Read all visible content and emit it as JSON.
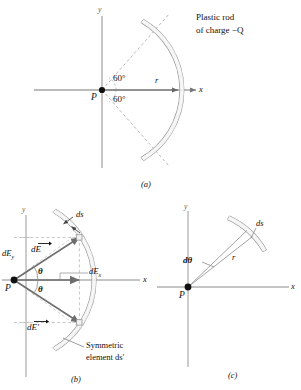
{
  "figure": {
    "type": "physics-diagram",
    "background_color": "#ffffff",
    "axis_color": "#777777",
    "rod_color": "#9a9a9a",
    "vector_color": "#666666",
    "dashed_color": "#aaaaaa",
    "text_color": "#111111"
  },
  "panel_a": {
    "caption": "(a)",
    "x_axis_label": "x",
    "y_axis_label": "y",
    "point_label": "P",
    "radius_label": "r",
    "angle_upper": "60°",
    "angle_lower": "60°",
    "rod_caption_line1": "Plastic rod",
    "rod_caption_line2": "of charge −Q",
    "arc_half_angle_deg": 60,
    "charge": "−Q"
  },
  "panel_b": {
    "caption": "(b)",
    "x_axis_label": "x",
    "y_axis_label": "y",
    "point_label": "P",
    "element_label": "ds",
    "field_vector": "dE",
    "field_vector_symmetric": "dE′",
    "component_x": "dE",
    "component_x_sub": "x",
    "component_y": "dE",
    "component_y_sub": "y",
    "angle_upper": "θ",
    "angle_lower": "θ",
    "symmetric_caption_line1": "Symmetric",
    "symmetric_caption_line2": "element ds′",
    "element_angle_deg": 33
  },
  "panel_c": {
    "caption": "(c)",
    "x_axis_label": "x",
    "y_axis_label": "y",
    "point_label": "P",
    "angle_label": "dθ",
    "radius_label": "r",
    "arc_element_label": "ds",
    "wedge_center_angle_deg": 45,
    "wedge_width_deg": 7
  }
}
